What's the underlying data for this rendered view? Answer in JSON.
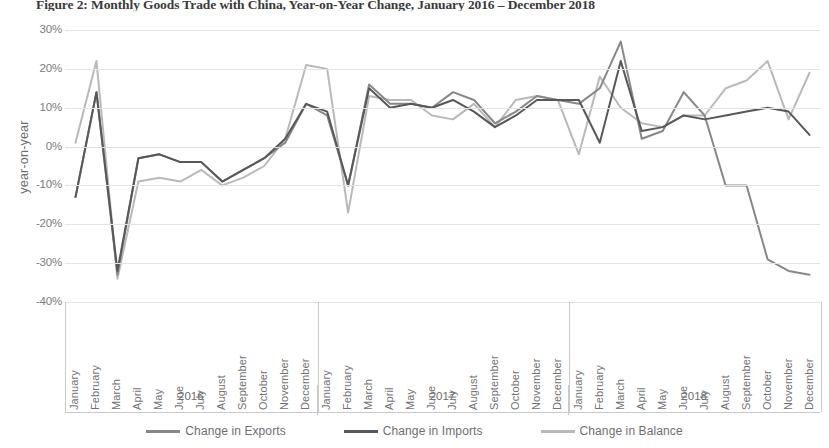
{
  "figure": {
    "title": "Figure 2: Monthly Goods Trade with China, Year-on-Year Change, January 2016 – December 2018"
  },
  "axes": {
    "y_title": "year-on-year",
    "y_ticks": [
      "30%",
      "20%",
      "10%",
      "0%",
      "-10%",
      "-20%",
      "-30%",
      "-40%"
    ],
    "year_groups": [
      {
        "label": "2016"
      },
      {
        "label": "2017"
      },
      {
        "label": "2018"
      }
    ],
    "months": [
      "January",
      "February",
      "March",
      "April",
      "May",
      "June",
      "July",
      "August",
      "September",
      "October",
      "November",
      "December"
    ]
  },
  "legend": {
    "items": [
      {
        "label": "Change in Exports",
        "color": "#878789"
      },
      {
        "label": "Change in Imports",
        "color": "#58585a"
      },
      {
        "label": "Change in Balance",
        "color": "#b9b9bb"
      }
    ]
  },
  "chart_data": {
    "type": "line",
    "title": "Figure 2: Monthly Goods Trade with China, Year-on-Year Change, January 2016 – December 2018",
    "xlabel": "",
    "ylabel": "year-on-year",
    "ylim": [
      -40,
      30
    ],
    "ytick_values": [
      30,
      20,
      10,
      0,
      -10,
      -20,
      -30,
      -40
    ],
    "grid": true,
    "legend_position": "bottom",
    "x": [
      "2016-January",
      "2016-February",
      "2016-March",
      "2016-April",
      "2016-May",
      "2016-June",
      "2016-July",
      "2016-August",
      "2016-September",
      "2016-October",
      "2016-November",
      "2016-December",
      "2017-January",
      "2017-February",
      "2017-March",
      "2017-April",
      "2017-May",
      "2017-June",
      "2017-July",
      "2017-August",
      "2017-September",
      "2017-October",
      "2017-November",
      "2017-December",
      "2018-January",
      "2018-February",
      "2018-March",
      "2018-April",
      "2018-May",
      "2018-June",
      "2018-July",
      "2018-August",
      "2018-September",
      "2018-October",
      "2018-November",
      "2018-December"
    ],
    "series": [
      {
        "name": "Change in Exports",
        "color": "#878789",
        "values": [
          -13,
          14,
          -33,
          -3,
          -2,
          -4,
          -4,
          -9,
          -6,
          -3,
          1,
          11,
          8,
          -10,
          16,
          11,
          11,
          10,
          14,
          12,
          6,
          9,
          13,
          12,
          11,
          15,
          27,
          2,
          4,
          14,
          8,
          -10,
          -10,
          -29,
          -32,
          -33
        ]
      },
      {
        "name": "Change in Imports",
        "color": "#58585a",
        "values": [
          -13,
          14,
          -32,
          -3,
          -2,
          -4,
          -4,
          -9,
          -6,
          -3,
          2,
          11,
          9,
          -10,
          15,
          10,
          11,
          10,
          12,
          9,
          5,
          8,
          12,
          12,
          12,
          1,
          22,
          4,
          5,
          8,
          7,
          8,
          9,
          10,
          9,
          3
        ]
      },
      {
        "name": "Change in Balance",
        "color": "#b9b9bb",
        "values": [
          1,
          22,
          -34,
          -9,
          -8,
          -9,
          -6,
          -10,
          -8,
          -5,
          2,
          21,
          20,
          -17,
          13,
          12,
          12,
          8,
          7,
          11,
          5,
          12,
          13,
          12,
          -2,
          18,
          10,
          6,
          5,
          8,
          8,
          15,
          17,
          22,
          7,
          19
        ]
      }
    ]
  }
}
